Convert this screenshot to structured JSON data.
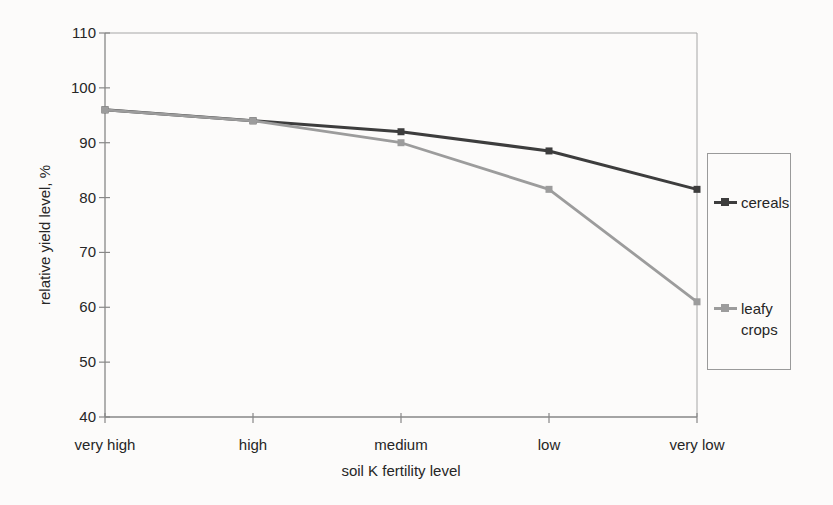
{
  "chart_data": {
    "type": "line",
    "categories": [
      "very high",
      "high",
      "medium",
      "low",
      "very low"
    ],
    "series": [
      {
        "name": "cereals",
        "values": [
          96,
          94,
          92,
          88.5,
          81.5
        ],
        "color": "#3d3d3d"
      },
      {
        "name": "leafy crops",
        "values": [
          96,
          94,
          90,
          81.5,
          61
        ],
        "color": "#9c9c9c"
      }
    ],
    "xlabel": "soil K fertility level",
    "ylabel": "relative yield level, %",
    "ylim": [
      40,
      110
    ],
    "yticks": [
      110,
      100,
      90,
      80,
      70,
      60,
      50,
      40
    ],
    "grid": false,
    "legend_position": "right",
    "marker": "square"
  }
}
